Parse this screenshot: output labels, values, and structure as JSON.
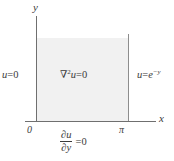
{
  "figure": {
    "type": "math-boundary-value-diagram",
    "fill_color": "#f1f1f1",
    "axis_color": "#6f6f6f",
    "text_color": "#3a3a3a"
  },
  "axes": {
    "x_label": "x",
    "y_label": "y",
    "origin_label": "0",
    "x_tick_label": "π"
  },
  "labels": {
    "left_boundary": {
      "variable": "u",
      "relation": "=",
      "value": "0",
      "full": "u = 0"
    },
    "right_boundary": {
      "variable": "u",
      "relation": "=",
      "base": "e",
      "exponent": "−y",
      "full": "u = e⁻ʸ"
    },
    "interior": {
      "operator": "∇",
      "power": "2",
      "variable": "u",
      "relation": "=",
      "value": "0",
      "full": "∇²u = 0"
    },
    "bottom_boundary": {
      "numerator": "∂u",
      "denominator": "∂y",
      "relation": "=",
      "value": "0",
      "full": "∂u/∂y = 0"
    }
  }
}
